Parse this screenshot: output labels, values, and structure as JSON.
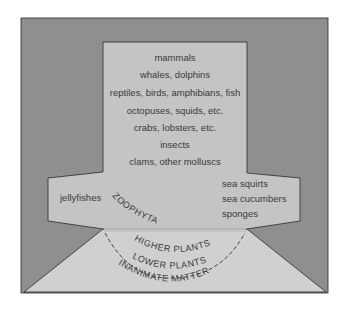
{
  "diagram": {
    "colors": {
      "outer_background": "#8f8f8f",
      "inner_region": "#c4c4c4",
      "bottom_region": "#d0d0d0",
      "outline": "#2a2a2a",
      "text": "#3a3a3a"
    },
    "center_column": [
      "mammals",
      "whales, dolphins",
      "reptiles, birds, amphibians, fish",
      "octopuses, squids, etc.",
      "crabs, lobsters, etc.",
      "insects",
      "clams, other molluscs"
    ],
    "left_arm": [
      "jellyfishes"
    ],
    "right_arm": [
      "sea squirts",
      "sea cucumbers",
      "sponges"
    ],
    "arc_labels": {
      "zoophyta": "ZOOPHYTA",
      "higher_plants": "HIGHER PLANTS",
      "lower_plants": "LOWER PLANTS",
      "inanimate_matter": "INANIMATE MATTER"
    }
  }
}
